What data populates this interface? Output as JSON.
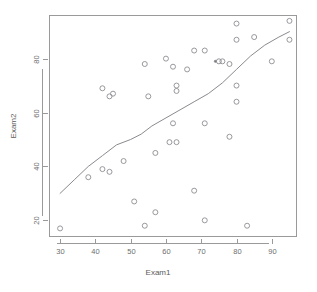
{
  "chart_data": {
    "type": "scatter",
    "title": "",
    "xlabel": "Exam1",
    "ylabel": "Exam2",
    "xlim": [
      27,
      97
    ],
    "ylim": [
      14,
      96
    ],
    "xticks": [
      30,
      40,
      50,
      60,
      70,
      80,
      90
    ],
    "yticks": [
      20,
      40,
      60,
      80
    ],
    "grid": false,
    "legend": null,
    "marker": "open-circle",
    "points": [
      {
        "x": 30,
        "y": 17
      },
      {
        "x": 38,
        "y": 36
      },
      {
        "x": 42,
        "y": 39
      },
      {
        "x": 42,
        "y": 69
      },
      {
        "x": 44,
        "y": 38
      },
      {
        "x": 44,
        "y": 66
      },
      {
        "x": 45,
        "y": 67
      },
      {
        "x": 48,
        "y": 42
      },
      {
        "x": 51,
        "y": 27
      },
      {
        "x": 54,
        "y": 18
      },
      {
        "x": 54,
        "y": 78
      },
      {
        "x": 55,
        "y": 66
      },
      {
        "x": 57,
        "y": 23
      },
      {
        "x": 57,
        "y": 45
      },
      {
        "x": 60,
        "y": 80
      },
      {
        "x": 61,
        "y": 49
      },
      {
        "x": 62,
        "y": 56
      },
      {
        "x": 62,
        "y": 77
      },
      {
        "x": 63,
        "y": 49
      },
      {
        "x": 63,
        "y": 68
      },
      {
        "x": 63,
        "y": 70
      },
      {
        "x": 66,
        "y": 76
      },
      {
        "x": 68,
        "y": 31
      },
      {
        "x": 68,
        "y": 83
      },
      {
        "x": 71,
        "y": 20
      },
      {
        "x": 71,
        "y": 56
      },
      {
        "x": 71,
        "y": 83
      },
      {
        "x": 75,
        "y": 79
      },
      {
        "x": 76,
        "y": 79
      },
      {
        "x": 78,
        "y": 51
      },
      {
        "x": 78,
        "y": 78
      },
      {
        "x": 80,
        "y": 64
      },
      {
        "x": 80,
        "y": 70
      },
      {
        "x": 80,
        "y": 87
      },
      {
        "x": 80,
        "y": 93
      },
      {
        "x": 83,
        "y": 18
      },
      {
        "x": 85,
        "y": 88
      },
      {
        "x": 90,
        "y": 79
      },
      {
        "x": 95,
        "y": 87
      },
      {
        "x": 95,
        "y": 94
      }
    ],
    "highlight_points": [
      {
        "x": 74,
        "y": 79
      }
    ],
    "smooth_line": {
      "name": "lowess",
      "x": [
        30,
        34,
        38,
        42,
        46,
        50,
        53,
        56,
        60,
        64,
        68,
        72,
        76,
        80,
        84,
        88,
        92,
        95
      ],
      "y": [
        30,
        35,
        40,
        44,
        48,
        50,
        52,
        55,
        58,
        61,
        64,
        67,
        71,
        76,
        81,
        85,
        88,
        90
      ]
    }
  },
  "axes": {
    "x_title": "Exam1",
    "y_title": "Exam2",
    "x_tick_labels": [
      "30",
      "40",
      "50",
      "60",
      "70",
      "80",
      "90"
    ],
    "y_tick_labels": [
      "20",
      "40",
      "60",
      "80"
    ]
  },
  "colors": {
    "background": "#ffffff",
    "frame": "#9a9a9a",
    "point": "#8d8d93",
    "line": "#8a8a90",
    "tick_text": "#6e6e6e",
    "axis_title": "#5a5a5a"
  }
}
